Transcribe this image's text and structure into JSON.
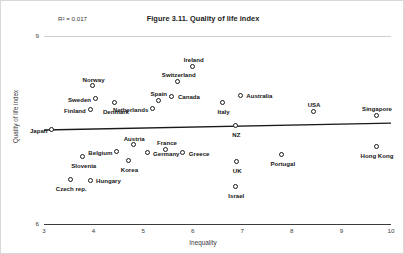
{
  "figure": {
    "title": "Figure 3.11. Quality of life index",
    "r2_annotation": "R² = 0.017"
  },
  "axes": {
    "x_title": "Inequality",
    "y_title": "Quality of life index",
    "x_ticks": [
      "3",
      "4",
      "5",
      "6",
      "7",
      "8",
      "9",
      "10"
    ],
    "y_ticks": [
      "9",
      "6"
    ]
  },
  "chart_data": {
    "type": "scatter",
    "title": "Figure 3.11. Quality of life index",
    "xlabel": "Inequality",
    "ylabel": "Quality of life index",
    "xlim": [
      3,
      10
    ],
    "ylim": [
      6,
      9
    ],
    "grid": false,
    "legend": null,
    "annotations": [
      "R² = 0.017"
    ],
    "trendline": {
      "type": "linear",
      "x_start": 3.0,
      "y_start": 7.5,
      "x_end": 10.0,
      "y_end": 7.61,
      "r_squared": 0.017
    },
    "points": [
      {
        "label": "Japan",
        "x": 3.18,
        "y": 7.49,
        "label_pos": "left"
      },
      {
        "label": "Finland",
        "x": 3.95,
        "y": 7.81,
        "label_pos": "left"
      },
      {
        "label": "Sweden",
        "x": 4.05,
        "y": 7.98,
        "label_pos": "left"
      },
      {
        "label": "Norway",
        "x": 4.0,
        "y": 8.19,
        "label_pos": "top"
      },
      {
        "label": "Denmark",
        "x": 4.45,
        "y": 7.93,
        "label_pos": "bottom"
      },
      {
        "label": "Slovenia",
        "x": 3.8,
        "y": 7.06,
        "label_pos": "bottom"
      },
      {
        "label": "Czech rep.",
        "x": 3.55,
        "y": 6.7,
        "label_pos": "bottom"
      },
      {
        "label": "Hungary",
        "x": 3.95,
        "y": 6.68,
        "label_pos": "right"
      },
      {
        "label": "Belgium",
        "x": 4.48,
        "y": 7.14,
        "label_pos": "left"
      },
      {
        "label": "Korea",
        "x": 4.72,
        "y": 7.0,
        "label_pos": "bottom"
      },
      {
        "label": "Austria",
        "x": 4.82,
        "y": 7.25,
        "label_pos": "top"
      },
      {
        "label": "Germany",
        "x": 5.1,
        "y": 7.12,
        "label_pos": "right"
      },
      {
        "label": "Netherlands",
        "x": 5.2,
        "y": 7.82,
        "label_pos": "left"
      },
      {
        "label": "Spain",
        "x": 5.32,
        "y": 7.96,
        "label_pos": "top"
      },
      {
        "label": "Canada",
        "x": 5.6,
        "y": 8.02,
        "label_pos": "right"
      },
      {
        "label": "Switzerland",
        "x": 5.72,
        "y": 8.26,
        "label_pos": "top"
      },
      {
        "label": "Ireland",
        "x": 6.02,
        "y": 8.5,
        "label_pos": "top"
      },
      {
        "label": "France",
        "x": 5.48,
        "y": 7.18,
        "label_pos": "top"
      },
      {
        "label": "Greece",
        "x": 5.82,
        "y": 7.12,
        "label_pos": "right"
      },
      {
        "label": "NZ",
        "x": 6.88,
        "y": 7.56,
        "label_pos": "bottom"
      },
      {
        "label": "Italy",
        "x": 6.62,
        "y": 7.92,
        "label_pos": "bottom"
      },
      {
        "label": "Australia",
        "x": 6.98,
        "y": 8.04,
        "label_pos": "right"
      },
      {
        "label": "UK",
        "x": 6.9,
        "y": 6.98,
        "label_pos": "bottom"
      },
      {
        "label": "Israel",
        "x": 6.88,
        "y": 6.58,
        "label_pos": "bottom"
      },
      {
        "label": "Portugal",
        "x": 7.82,
        "y": 7.1,
        "label_pos": "bottom"
      },
      {
        "label": "USA",
        "x": 8.45,
        "y": 7.78,
        "label_pos": "top"
      },
      {
        "label": "Singapore",
        "x": 9.72,
        "y": 7.72,
        "label_pos": "top"
      },
      {
        "label": "Hong Kong",
        "x": 9.72,
        "y": 7.22,
        "label_pos": "bottom"
      }
    ]
  }
}
